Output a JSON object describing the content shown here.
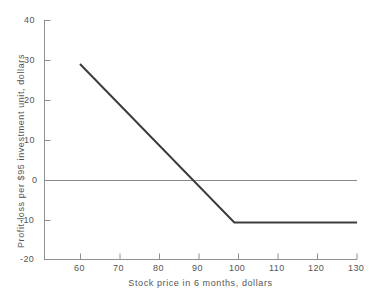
{
  "chart_data": {
    "type": "line",
    "title": "",
    "xlabel": "Stock price in 6 months, dollars",
    "ylabel": "Profit-loss per $95 investment unit, dollars",
    "xlim": [
      51,
      130
    ],
    "ylim": [
      -20,
      40
    ],
    "xticks": [
      60,
      70,
      80,
      90,
      100,
      110,
      120,
      130
    ],
    "xtick_labels": [
      "60",
      "70",
      "80",
      "90",
      "100",
      "110",
      "120",
      "130"
    ],
    "yticks": [
      -20,
      -10,
      0,
      10,
      20,
      30,
      40
    ],
    "ytick_labels": [
      "-20",
      "-10",
      "0",
      "10",
      "20",
      "30",
      "40"
    ],
    "grid": false,
    "legend": null,
    "series": [
      {
        "name": "Profit-loss",
        "color": "#3c3c3c",
        "x": [
          60,
          99,
          130
        ],
        "values": [
          29,
          -10.6,
          -10.6
        ]
      }
    ],
    "annotations": [
      {
        "name": "zero-reference-line",
        "kind": "hline",
        "y": 0,
        "x_start": 51,
        "x_end": 130,
        "color": "#888888"
      },
      {
        "name": "break-even-point",
        "x": 89.4,
        "y": 0
      },
      {
        "name": "kink-point",
        "x": 99,
        "y": -10.6
      }
    ]
  }
}
